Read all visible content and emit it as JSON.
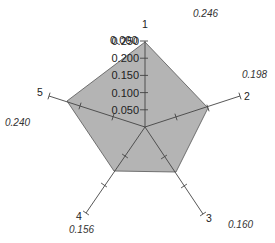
{
  "chart_data": {
    "type": "radar",
    "title": "",
    "axes": [
      "1",
      "2",
      "3",
      "4",
      "5"
    ],
    "values": [
      0.246,
      0.198,
      0.16,
      0.156,
      0.24
    ],
    "value_labels": [
      "0.246",
      "0.198",
      "0.160",
      "0.156",
      "0.240"
    ],
    "radial_tick_labels": [
      "0.000",
      "0.050",
      "0.100",
      "0.150",
      "0.200",
      "0.250"
    ],
    "axis_ranges": [
      [
        0,
        0.25
      ],
      [
        0,
        0.3
      ],
      [
        0,
        0.3
      ],
      [
        0,
        0.3
      ],
      [
        0,
        0.3
      ]
    ],
    "legend": null,
    "grid": false
  },
  "style": {
    "fill_color": "#b4b4b4",
    "stroke_color": "#555555",
    "axis_color": "#444444",
    "background": "#ffffff"
  },
  "layout": {
    "center": [
      145,
      127
    ],
    "axis_ends": [
      [
        145,
        41
      ],
      [
        240,
        96
      ],
      [
        203,
        214
      ],
      [
        86,
        213
      ],
      [
        49,
        96
      ]
    ],
    "vertices": [
      [
        145,
        42
      ],
      [
        208,
        108
      ],
      [
        176,
        172
      ],
      [
        114,
        171
      ],
      [
        67,
        101
      ]
    ],
    "axis_ticks": [
      [],
      [
        [
          176,
          117
        ],
        [
          208,
          108
        ],
        [
          240,
          96
        ]
      ],
      [
        [
          164,
          157
        ],
        [
          184,
          186
        ],
        [
          203,
          214
        ]
      ],
      [
        [
          125,
          156
        ],
        [
          104,
          185
        ],
        [
          86,
          213
        ]
      ],
      [
        [
          113,
          117
        ],
        [
          80,
          106
        ],
        [
          49,
          96
        ]
      ]
    ],
    "axis_label_pos": [
      [
        142,
        28
      ],
      [
        244,
        100
      ],
      [
        206,
        222
      ],
      [
        76,
        220
      ],
      [
        37,
        96
      ]
    ],
    "value_label_pos": [
      [
        193,
        17
      ],
      [
        242,
        78
      ],
      [
        228,
        228
      ],
      [
        69,
        233
      ],
      [
        5,
        126
      ]
    ],
    "radial_label_pos": [
      [
        136,
        44
      ],
      [
        136,
        61
      ],
      [
        136,
        78
      ],
      [
        136,
        95
      ],
      [
        136,
        112
      ],
      [
        124,
        131
      ]
    ]
  }
}
